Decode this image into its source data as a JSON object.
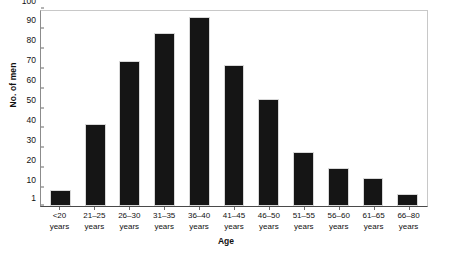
{
  "chart_data": {
    "type": "bar",
    "title": "",
    "xlabel": "Age",
    "ylabel": "No. of men",
    "categories": [
      "<20 years",
      "21–25 years",
      "26–30 years",
      "31–35 years",
      "36–40 years",
      "41–45 years",
      "46–50 years",
      "51–55 years",
      "56–60 years",
      "61–65 years",
      "66–80 years"
    ],
    "category_lines": [
      [
        "<20",
        "years"
      ],
      [
        "21–25",
        "years"
      ],
      [
        "26–30",
        "years"
      ],
      [
        "31–35",
        "years"
      ],
      [
        "36–40",
        "years"
      ],
      [
        "41–45",
        "years"
      ],
      [
        "46–50",
        "years"
      ],
      [
        "51–55",
        "years"
      ],
      [
        "56–60",
        "years"
      ],
      [
        "61–65",
        "years"
      ],
      [
        "66–80",
        "years"
      ]
    ],
    "values": [
      9,
      42,
      74,
      88,
      96,
      72,
      55,
      28,
      20,
      15,
      7
    ],
    "ylim": [
      1,
      100
    ],
    "yticks": [
      1,
      10,
      20,
      30,
      40,
      50,
      60,
      70,
      80,
      90,
      100
    ],
    "ytick_labels": [
      "1",
      "10",
      "20",
      "30",
      "40",
      "50",
      "60",
      "70",
      "80",
      "90",
      "100"
    ],
    "grid": false,
    "legend": null,
    "bar_color": "#151515",
    "axis_color": "#4a4a4a",
    "frame_color": "#c8c8c8",
    "text_color": "#111111"
  }
}
